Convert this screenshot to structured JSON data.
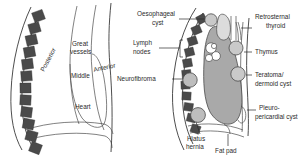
{
  "figure": {
    "background_color": "#ffffff",
    "line_color": "#3a3a3a",
    "text_color": "#2b2b2b",
    "vertebra_color": "#4a4a4a",
    "heart_fill": "#a9a9a9",
    "mass_fill": "#c9c9c9"
  },
  "panels": [
    {
      "id": "left-panel",
      "name": "mediastinal-compartments",
      "labels": [
        {
          "key": "posterior",
          "text": "Posterior"
        },
        {
          "key": "great_vessels_line1",
          "text": "Great"
        },
        {
          "key": "great_vessels_line2",
          "text": "vessels"
        },
        {
          "key": "middle",
          "text": "Middle"
        },
        {
          "key": "anterior",
          "text": "Anterior"
        },
        {
          "key": "heart",
          "text": "Heart"
        }
      ]
    },
    {
      "id": "right-panel",
      "name": "mediastinal-masses",
      "labels": [
        {
          "key": "oesophageal_cyst_line1",
          "text": "Oesophageal"
        },
        {
          "key": "oesophageal_cyst_line2",
          "text": "cyst"
        },
        {
          "key": "lymph_nodes_line1",
          "text": "Lymph"
        },
        {
          "key": "lymph_nodes_line2",
          "text": "nodes"
        },
        {
          "key": "neurofibroma",
          "text": "Neurofibroma"
        },
        {
          "key": "hiatus_hernia_line1",
          "text": "Hiatus"
        },
        {
          "key": "hiatus_hernia_line2",
          "text": "hernia"
        },
        {
          "key": "fat_pad",
          "text": "Fat pad"
        },
        {
          "key": "retrosternal_thyroid_line1",
          "text": "Retrosternal"
        },
        {
          "key": "retrosternal_thyroid_line2",
          "text": "thyroid"
        },
        {
          "key": "thymus",
          "text": "Thymus"
        },
        {
          "key": "teratoma_line1",
          "text": "Teratoma/"
        },
        {
          "key": "teratoma_line2",
          "text": "dermoid cyst"
        },
        {
          "key": "pleuropericardial_cyst_line1",
          "text": "Pleuro-"
        },
        {
          "key": "pleuropericardial_cyst_line2",
          "text": "pericardial cyst"
        }
      ]
    }
  ],
  "left": {
    "posterior": "Posterior",
    "great_vessels_1": "Great",
    "great_vessels_2": "vessels",
    "middle": "Middle",
    "anterior": "Anterior",
    "heart": "Heart"
  },
  "right": {
    "oesophageal_cyst_1": "Oesophageal",
    "oesophageal_cyst_2": "cyst",
    "lymph_nodes_1": "Lymph",
    "lymph_nodes_2": "nodes",
    "neurofibroma": "Neurofibroma",
    "hiatus_hernia_1": "Hiatus",
    "hiatus_hernia_2": "hernia",
    "fat_pad": "Fat pad",
    "retrosternal_thyroid_1": "Retrosternal",
    "retrosternal_thyroid_2": "thyroid",
    "thymus": "Thymus",
    "teratoma_1": "Teratoma/",
    "teratoma_2": "dermoid cyst",
    "pleuropericardial_1": "Pleuro-",
    "pleuropericardial_2": "pericardial cyst"
  }
}
